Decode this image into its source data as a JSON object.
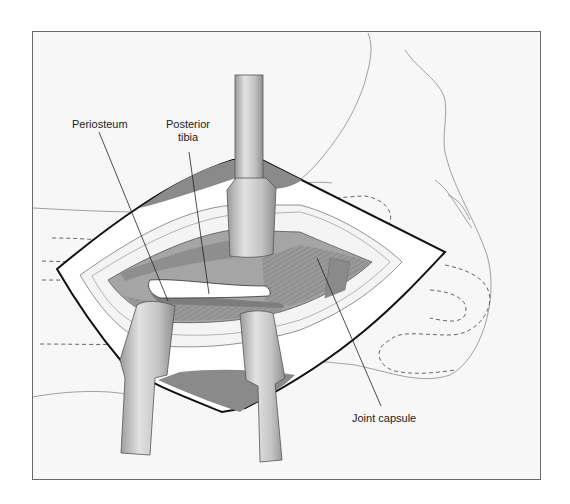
{
  "figure": {
    "type": "surgical illustration",
    "labels": {
      "periosteum": "Periosteum",
      "posterior_tibia_line1": "Posterior",
      "posterior_tibia_line2": "tibia",
      "joint_capsule": "Joint capsule"
    },
    "colors": {
      "background": "#f7f7f7",
      "outline": "#111111",
      "tissue_dark": "#8c8c8c",
      "tissue_mid": "#a8a8a8",
      "retractor": "#c8c8c8",
      "bone": "#ffffff"
    },
    "retractors": 3
  }
}
